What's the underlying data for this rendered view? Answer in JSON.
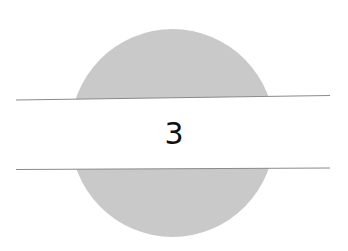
{
  "figure": {
    "label": "3",
    "colors": {
      "disc": "#c9c9c9",
      "band": "#ffffff",
      "band_border": "#8a8a8a",
      "text": "#111111"
    }
  }
}
